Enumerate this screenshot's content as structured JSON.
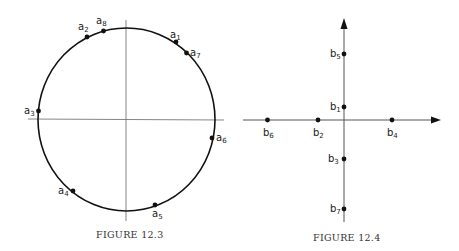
{
  "figures": [
    {
      "caption": "Figure 12.3",
      "caption_display": "FIGURE 12.3",
      "description": "Unit circle with eight points a1..a8 on the circumference",
      "points": [
        {
          "name": "a1",
          "base": "a",
          "sub": "1"
        },
        {
          "name": "a2",
          "base": "a",
          "sub": "2"
        },
        {
          "name": "a3",
          "base": "a",
          "sub": "3"
        },
        {
          "name": "a4",
          "base": "a",
          "sub": "4"
        },
        {
          "name": "a5",
          "base": "a",
          "sub": "5"
        },
        {
          "name": "a6",
          "base": "a",
          "sub": "6"
        },
        {
          "name": "a7",
          "base": "a",
          "sub": "7"
        },
        {
          "name": "a8",
          "base": "a",
          "sub": "8"
        }
      ]
    },
    {
      "caption": "Figure 12.4",
      "caption_display": "FIGURE 12.4",
      "description": "Coordinate axes with points b1..b7 on the axes",
      "points": [
        {
          "name": "b1",
          "base": "b",
          "sub": "1"
        },
        {
          "name": "b2",
          "base": "b",
          "sub": "2"
        },
        {
          "name": "b3",
          "base": "b",
          "sub": "3"
        },
        {
          "name": "b4",
          "base": "b",
          "sub": "4"
        },
        {
          "name": "b5",
          "base": "b",
          "sub": "5"
        },
        {
          "name": "b6",
          "base": "b",
          "sub": "6"
        },
        {
          "name": "b7",
          "base": "b",
          "sub": "7"
        }
      ]
    }
  ],
  "colors": {
    "ink": "#111111",
    "axis": "#555555",
    "caption": "#333333"
  }
}
